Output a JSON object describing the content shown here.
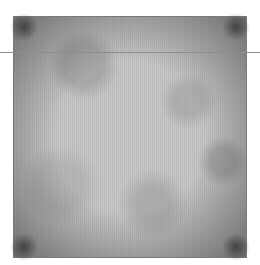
{
  "image": {
    "description": "Grey mottled texture square with darkened vignette corners",
    "colors": {
      "base": "#c4c4c4",
      "border": "#7a7a7a",
      "line": "#8e8e8e",
      "background": "#ffffff"
    }
  },
  "overlay": {
    "horizontal_line": true
  }
}
